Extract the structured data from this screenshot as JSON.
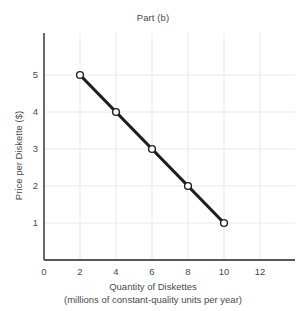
{
  "chart_data": {
    "type": "line",
    "title": "Part (b)",
    "xlabel": "Quantity of Diskettes",
    "xlabel_sub": "(millions of constant-quality units per year)",
    "ylabel": "Price per Diskette ($)",
    "xlim": [
      0,
      13.5
    ],
    "ylim": [
      0,
      5.9
    ],
    "xticks": [
      0,
      2,
      4,
      6,
      8,
      10,
      12
    ],
    "xtick_labels": [
      "0",
      "2",
      "4",
      "6",
      "8",
      "10",
      "12"
    ],
    "yticks": [
      1,
      2,
      3,
      4,
      5
    ],
    "ytick_labels": [
      "1",
      "2",
      "3",
      "4",
      "5"
    ],
    "grid": true,
    "legend": null,
    "series": [
      {
        "name": "Demand",
        "x": [
          2,
          4,
          6,
          8,
          10
        ],
        "values": [
          5,
          4,
          3,
          2,
          1
        ],
        "marker": "open-circle",
        "line_color": "#1f1f1f",
        "marker_face_color": "#ffffff",
        "marker_edge_color": "#1f1f1f"
      }
    ],
    "colors": {
      "background": "#ffffff",
      "grid": "#e9e9e9",
      "axis": "#575757",
      "text": "#4a4a4a",
      "line": "#1f1f1f"
    }
  }
}
